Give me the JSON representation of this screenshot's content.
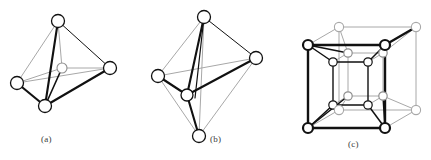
{
  "figure": {
    "background_color": "#ffffff",
    "stroke_front_color": "#111111",
    "stroke_back_color": "#a8a8a8",
    "node_fill_color": "#ffffff",
    "node_stroke_front_color": "#111111",
    "node_stroke_back_color": "#a8a8a8",
    "caption_color": "#3a3a3a"
  },
  "panels": [
    {
      "id": "a",
      "caption": "(a)",
      "name": "tetrahedral-coordination-polyhedron",
      "description": "Tetrahedron of four large open circles with one small open circle at the centre, bonds drawn from centre to each vertex.",
      "vertices": [
        {
          "label": "top",
          "x": 58,
          "y": 21,
          "r": 6.5,
          "depth": "front"
        },
        {
          "label": "left",
          "x": 17,
          "y": 83,
          "r": 6.5,
          "depth": "front"
        },
        {
          "label": "bottom",
          "x": 45,
          "y": 106,
          "r": 6.5,
          "depth": "front"
        },
        {
          "label": "right",
          "x": 110,
          "y": 68,
          "r": 6.5,
          "depth": "front"
        },
        {
          "label": "centre",
          "x": 62,
          "y": 68,
          "r": 5.0,
          "depth": "front"
        }
      ],
      "edges_front": [
        [
          "top",
          "bottom"
        ],
        [
          "left",
          "bottom"
        ],
        [
          "bottom",
          "right"
        ],
        [
          "top",
          "right"
        ]
      ],
      "edges_back": [
        [
          "top",
          "left"
        ],
        [
          "left",
          "right"
        ]
      ],
      "bonds_to_centre": [
        "top",
        "left",
        "bottom",
        "right"
      ]
    },
    {
      "id": "b",
      "caption": "(b)",
      "name": "octahedral-coordination-polyhedron",
      "description": "Octahedron (square bipyramid) of six large open circles with bonds from the front equatorial atom outward.",
      "vertices": [
        {
          "label": "top",
          "x": 69,
          "y": 17,
          "r": 6.5,
          "depth": "front"
        },
        {
          "label": "bottom",
          "x": 64,
          "y": 136,
          "r": 6.5,
          "depth": "front"
        },
        {
          "label": "left",
          "x": 23,
          "y": 76,
          "r": 6.5,
          "depth": "front"
        },
        {
          "label": "right",
          "x": 121,
          "y": 58,
          "r": 6.5,
          "depth": "front"
        },
        {
          "label": "front",
          "x": 52,
          "y": 95,
          "r": 6.0,
          "depth": "front"
        },
        {
          "label": "back",
          "x": 88,
          "y": 58,
          "r": 0.0,
          "depth": "back"
        }
      ],
      "edges_front": [
        [
          "top",
          "front"
        ],
        [
          "front",
          "right"
        ],
        [
          "left",
          "front"
        ],
        [
          "front",
          "bottom"
        ],
        [
          "top",
          "right"
        ],
        [
          "top",
          "bottom"
        ]
      ],
      "edges_back": [
        [
          "top",
          "left"
        ],
        [
          "left",
          "bottom"
        ],
        [
          "right",
          "bottom"
        ],
        [
          "left",
          "right"
        ]
      ]
    },
    {
      "id": "c",
      "caption": "(c)",
      "name": "cubic-coordination-polyhedron",
      "description": "Outer cube of eight open circles with an inner smaller cube of eight open circles; front faces drawn heavy, rear faces drawn light.",
      "outer_front_face": [
        {
          "label": "ftl",
          "x": 28,
          "y": 45
        },
        {
          "label": "ftr",
          "x": 105,
          "y": 45
        },
        {
          "label": "fbr",
          "x": 105,
          "y": 128
        },
        {
          "label": "fbl",
          "x": 28,
          "y": 128
        }
      ],
      "outer_back_face": [
        {
          "label": "btl",
          "x": 59,
          "y": 27
        },
        {
          "label": "btr",
          "x": 136,
          "y": 27
        },
        {
          "label": "bbr",
          "x": 136,
          "y": 110
        },
        {
          "label": "bbl",
          "x": 59,
          "y": 110
        }
      ],
      "inner_front_face": [
        {
          "label": "iftl",
          "x": 53,
          "y": 62
        },
        {
          "label": "iftr",
          "x": 88,
          "y": 62
        },
        {
          "label": "ifbr",
          "x": 88,
          "y": 105
        },
        {
          "label": "ifbl",
          "x": 53,
          "y": 105
        }
      ],
      "inner_back_face": [
        {
          "label": "ibtl",
          "x": 68,
          "y": 53
        },
        {
          "label": "ibtr",
          "x": 103,
          "y": 53
        },
        {
          "label": "ibbr",
          "x": 103,
          "y": 96
        },
        {
          "label": "ibbl",
          "x": 68,
          "y": 96
        }
      ],
      "outer_node_radius_front": 5.0,
      "outer_node_radius_back": 4.5,
      "inner_node_radius": 4.2,
      "corner_bond_pairs": [
        [
          "ftl",
          "iftl"
        ],
        [
          "ftl",
          "ibtl"
        ],
        [
          "ftr",
          "iftr"
        ],
        [
          "ftr",
          "ibtr"
        ],
        [
          "fbl",
          "ifbl"
        ],
        [
          "fbl",
          "ibbl"
        ],
        [
          "fbr",
          "ifbr"
        ],
        [
          "fbr",
          "ibbr"
        ],
        [
          "btl",
          "ibtl"
        ],
        [
          "btr",
          "ibtr"
        ],
        [
          "bbl",
          "ibbl"
        ],
        [
          "bbr",
          "ibbr"
        ]
      ]
    }
  ]
}
